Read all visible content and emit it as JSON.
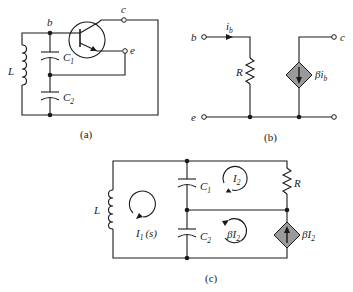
{
  "figure": {
    "panels": [
      {
        "id": "a",
        "caption": "(a)",
        "labels": {
          "base": "b",
          "collector": "c",
          "emitter": "e",
          "inductor": "L",
          "cap1": "C",
          "cap1_sub": "1",
          "cap2": "C",
          "cap2_sub": "2"
        }
      },
      {
        "id": "b",
        "caption": "(b)",
        "labels": {
          "base": "b",
          "collector": "c",
          "emitter": "e",
          "current": "i",
          "current_sub": "b",
          "resistor": "R",
          "source": "βi",
          "source_sub": "b"
        }
      },
      {
        "id": "c",
        "caption": "(c)",
        "labels": {
          "inductor": "L",
          "cap1": "C",
          "cap1_sub": "1",
          "cap2": "C",
          "cap2_sub": "2",
          "resistor": "R",
          "loop1": "I",
          "loop1_sub": "1",
          "loop1_arg": "(s)",
          "loop2": "I",
          "loop2_sub": "2",
          "loop3": "βI",
          "loop3_sub": "2",
          "source": "βI",
          "source_sub": "2"
        }
      }
    ],
    "colors": {
      "wire": "#1a1a1a",
      "dependent_source_fill": "#9a9a9a",
      "background": "#ffffff"
    }
  }
}
